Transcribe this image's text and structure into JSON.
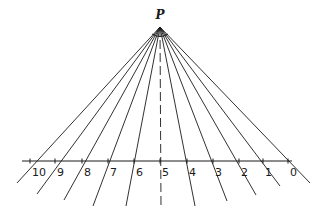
{
  "diagram": {
    "point_label": "P",
    "apex": {
      "x": 160,
      "y": 27
    },
    "baseline": {
      "y": 161,
      "x_start": 22,
      "x_end": 292
    },
    "rays": [
      {
        "label": "10",
        "tick_x": 30,
        "end": {
          "x": 17,
          "y": 183
        }
      },
      {
        "label": "9",
        "tick_x": 55,
        "end": {
          "x": 37,
          "y": 194
        }
      },
      {
        "label": "8",
        "tick_x": 82,
        "end": {
          "x": 64,
          "y": 200
        }
      },
      {
        "label": "7",
        "tick_x": 108,
        "end": {
          "x": 93,
          "y": 206
        }
      },
      {
        "label": "6",
        "tick_x": 134,
        "end": {
          "x": 126,
          "y": 206
        }
      },
      {
        "label": "5",
        "tick_x": 160,
        "end": {
          "x": 161,
          "y": 207
        },
        "dashed": true
      },
      {
        "label": "4",
        "tick_x": 187,
        "end": {
          "x": 195,
          "y": 206
        }
      },
      {
        "label": "3",
        "tick_x": 213,
        "end": {
          "x": 227,
          "y": 201
        }
      },
      {
        "label": "2",
        "tick_x": 239,
        "end": {
          "x": 256,
          "y": 195
        }
      },
      {
        "label": "1",
        "tick_x": 263,
        "end": {
          "x": 280,
          "y": 186
        }
      },
      {
        "label": "0",
        "tick_x": 288,
        "end": {
          "x": 310,
          "y": 183
        }
      }
    ],
    "stroke_color": "#1a1a1a"
  }
}
